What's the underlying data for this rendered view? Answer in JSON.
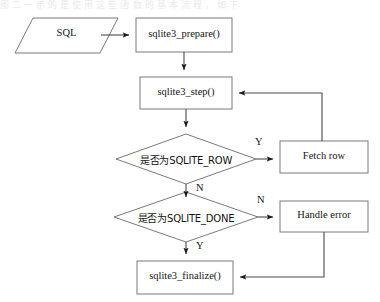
{
  "page": {
    "top_caption_remnant": "图 二 一 示 的 是 使 用 这 些 函 数 的 基 本 流 程 ， 如 下"
  },
  "diagram": {
    "nodes": [
      {
        "id": "sql-input",
        "label": "SQL",
        "shape": "parallelogram"
      },
      {
        "id": "prepare",
        "label": "sqlite3_prepare()",
        "shape": "rectangle"
      },
      {
        "id": "step",
        "label": "sqlite3_step()",
        "shape": "rectangle"
      },
      {
        "id": "decision-row",
        "label": "是否为SQLITE_ROW",
        "shape": "diamond"
      },
      {
        "id": "fetch-row",
        "label": "Fetch  row",
        "shape": "rectangle"
      },
      {
        "id": "decision-done",
        "label": "是否为SQLITE_DONE",
        "shape": "diamond"
      },
      {
        "id": "handle-error",
        "label": "Handle error",
        "shape": "rectangle"
      },
      {
        "id": "finalize",
        "label": "sqlite3_finalize()",
        "shape": "rectangle"
      }
    ],
    "edge_labels": {
      "row_yes": "Y",
      "row_no": "N",
      "done_no": "N",
      "done_yes": "Y"
    },
    "colors": {
      "stroke": "#7a7a7a",
      "arrow": "#1a1a1a",
      "background": "#ffffff",
      "text": "#141414"
    }
  }
}
